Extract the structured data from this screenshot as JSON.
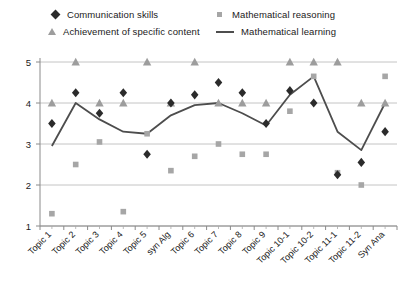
{
  "legend": {
    "entries": [
      {
        "label": "Communication skills",
        "marker": "diamond-marker",
        "color": "#2b2b2b"
      },
      {
        "label": "Mathematical reasoning",
        "marker": "square-marker",
        "color": "#a6a6a6"
      },
      {
        "label": "Achievement of specific content",
        "marker": "triangle-marker",
        "color": "#9d9d9d"
      },
      {
        "label": "Mathematical learning",
        "marker": "line-marker",
        "color": "#4d4d4d"
      }
    ]
  },
  "chart_data": {
    "type": "scatter",
    "title": "",
    "xlabel": "",
    "ylabel": "",
    "ylim": [
      1,
      5
    ],
    "yticks": [
      1,
      2,
      3,
      4,
      5
    ],
    "grid": true,
    "legend_position": "top",
    "categories": [
      "Topic 1",
      "Topic 2",
      "Topic 3",
      "Topic 4",
      "Topic 5",
      "syn Alg",
      "Topic 6",
      "Topic 7",
      "Topic 8",
      "Topic 9",
      "Topic 10-1",
      "Topic 10-2",
      "Topic 11-1",
      "Topic 11-2",
      "Syn Ana"
    ],
    "series": [
      {
        "name": "Communication skills",
        "marker": "diamond",
        "color": "#2b2b2b",
        "values": [
          3.5,
          4.25,
          3.75,
          4.25,
          2.75,
          4.0,
          4.2,
          4.5,
          4.25,
          3.5,
          4.3,
          4.0,
          2.25,
          2.55,
          3.3
        ]
      },
      {
        "name": "Mathematical reasoning",
        "marker": "square",
        "color": "#a6a6a6",
        "values": [
          1.3,
          2.5,
          3.05,
          1.35,
          3.25,
          2.35,
          2.7,
          3.0,
          2.75,
          2.75,
          3.8,
          4.65,
          2.3,
          2.0,
          4.65
        ]
      },
      {
        "name": "Achievement of specific content",
        "marker": "triangle",
        "color": "#9d9d9d",
        "values": [
          4.0,
          5.0,
          4.0,
          4.0,
          5.0,
          4.0,
          5.0,
          4.0,
          4.0,
          4.0,
          5.0,
          5.0,
          5.0,
          4.0,
          4.0
        ]
      },
      {
        "name": "Mathematical learning",
        "marker": "line",
        "color": "#4d4d4d",
        "values": [
          2.95,
          4.0,
          3.6,
          3.3,
          3.25,
          3.7,
          3.95,
          4.0,
          3.75,
          3.45,
          4.2,
          4.65,
          3.3,
          2.85,
          4.0
        ]
      }
    ]
  }
}
